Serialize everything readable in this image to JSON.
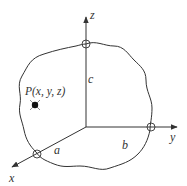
{
  "diagram": {
    "axes": {
      "x_label": "x",
      "y_label": "y",
      "z_label": "z"
    },
    "intercepts": {
      "a_label": "a",
      "b_label": "b",
      "c_label": "c"
    },
    "point": {
      "label": "P(x, y, z)"
    },
    "colors": {
      "stroke": "#333333",
      "background": "#ffffff"
    }
  }
}
